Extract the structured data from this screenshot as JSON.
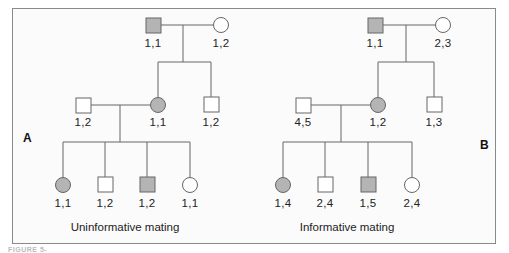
{
  "colors": {
    "affected_fill": "#b4b4b4",
    "unaffected_fill": "#ffffff",
    "line": "#666666",
    "frame": "#8a8a8a"
  },
  "legend_semantics": {
    "shaded": "affected",
    "unshaded": "unaffected",
    "square": "male",
    "circle": "female"
  },
  "panels": [
    {
      "letter": "A",
      "caption": "Uninformative mating",
      "generation_1": [
        {
          "sex": "male",
          "affected": true,
          "genotype": "1,1"
        },
        {
          "sex": "female",
          "affected": false,
          "genotype": "1,2"
        }
      ],
      "generation_2": [
        {
          "sex": "male",
          "affected": false,
          "genotype": "1,2",
          "role": "spouse"
        },
        {
          "sex": "female",
          "affected": true,
          "genotype": "1,1"
        },
        {
          "sex": "male",
          "affected": false,
          "genotype": "1,2"
        }
      ],
      "generation_3": [
        {
          "sex": "female",
          "affected": true,
          "genotype": "1,1"
        },
        {
          "sex": "male",
          "affected": false,
          "genotype": "1,2"
        },
        {
          "sex": "male",
          "affected": true,
          "genotype": "1,2"
        },
        {
          "sex": "female",
          "affected": false,
          "genotype": "1,1"
        }
      ]
    },
    {
      "letter": "B",
      "caption": "Informative mating",
      "generation_1": [
        {
          "sex": "male",
          "affected": true,
          "genotype": "1,1"
        },
        {
          "sex": "female",
          "affected": false,
          "genotype": "2,3"
        }
      ],
      "generation_2": [
        {
          "sex": "male",
          "affected": false,
          "genotype": "4,5",
          "role": "spouse"
        },
        {
          "sex": "female",
          "affected": true,
          "genotype": "1,2"
        },
        {
          "sex": "male",
          "affected": false,
          "genotype": "1,3"
        }
      ],
      "generation_3": [
        {
          "sex": "female",
          "affected": true,
          "genotype": "1,4"
        },
        {
          "sex": "male",
          "affected": false,
          "genotype": "2,4"
        },
        {
          "sex": "male",
          "affected": true,
          "genotype": "1,5"
        },
        {
          "sex": "female",
          "affected": false,
          "genotype": "2,4"
        }
      ]
    }
  ],
  "figure_caption_fragment": "FIGURE 5-"
}
